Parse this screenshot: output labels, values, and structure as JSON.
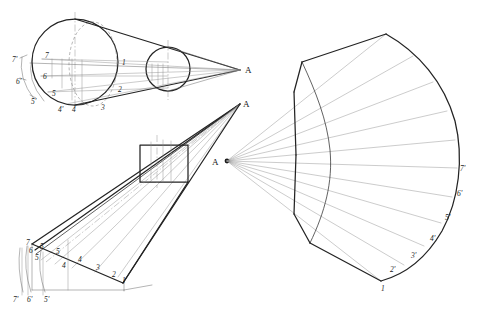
{
  "drawing": {
    "title": "Cone development construction drawing",
    "background_color": "#ffffff",
    "ink_color": "#232323",
    "views": [
      {
        "id": "top-left-view",
        "name": "Front elevation of truncated cone with circular base",
        "apex_label": "A",
        "base_point_labels": [
          "7'",
          "6'",
          "5'",
          "4'",
          "4",
          "3"
        ],
        "element_labels": [
          "7",
          "6",
          "5",
          "1",
          "2"
        ]
      },
      {
        "id": "bottom-left-view",
        "name": "Oblique / pictorial view of cone with cutting plane",
        "apex_label": "A",
        "element_labels": [
          "7",
          "6",
          "5",
          "4",
          "3",
          "2",
          "1"
        ],
        "base_labels": [
          "7'",
          "6'",
          "5'"
        ]
      },
      {
        "id": "right-view",
        "name": "Flat pattern development of cone surface",
        "apex_label": "A",
        "arc_labels": [
          "1",
          "2'",
          "3'",
          "4'",
          "5'",
          "6'",
          "7'"
        ]
      }
    ],
    "labels": {
      "apex_top": "A",
      "apex_mid": "A",
      "apex_dev": "A",
      "tl_7p": "7'",
      "tl_7": "7",
      "tl_6p": "6'",
      "tl_6": "6",
      "tl_5p": "5'",
      "tl_5": "5",
      "tl_4p": "4'",
      "tl_4": "4",
      "tl_3": "3",
      "tl_1": "1",
      "tl_2": "2",
      "bl_7": "7",
      "bl_6": "6",
      "bl_5": "5",
      "bl_5b": "5",
      "bl_4": "4",
      "bl_4b": "4",
      "bl_3": "3",
      "bl_2": "2",
      "bl_1": "1",
      "bl_7p": "7'",
      "bl_6p": "6'",
      "bl_5p": "5'",
      "dev_1": "1",
      "dev_2p": "2'",
      "dev_3p": "3'",
      "dev_4p": "4'",
      "dev_5p": "5'",
      "dev_6p": "6'",
      "dev_7p": "7'"
    }
  }
}
